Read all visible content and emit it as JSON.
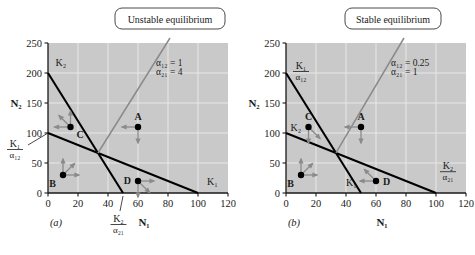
{
  "figure": {
    "background": "#ffffff",
    "plot_bg": "#c9c9c9",
    "grid_color": "#e8e8e8",
    "line_color": "#000000",
    "arrow_color": "#8a8a8a",
    "leader_color": "#8a8a8a"
  },
  "panels": [
    {
      "id": "a",
      "caption": "(a)",
      "callout": "Unstable equilibrium",
      "params": {
        "alpha12": "α₁₂ = 1",
        "alpha21": "α₂₁ = 4"
      },
      "axes": {
        "xlabel": "N₁",
        "ylabel": "N₂",
        "xticks": [
          "0",
          "20",
          "40",
          "60",
          "80",
          "100",
          "120"
        ],
        "yticks": [
          "0",
          "50",
          "100",
          "150",
          "200",
          "250"
        ],
        "xlim": [
          0,
          120
        ],
        "ylim": [
          0,
          250
        ]
      },
      "axis_annotations": [
        {
          "name": "k1-over-a12",
          "num": "K₁",
          "den": "α₁₂",
          "value": 100,
          "axis": "y"
        },
        {
          "name": "k2-over-a21",
          "num": "K₂",
          "den": "α₂₁",
          "value": 50,
          "axis": "x"
        }
      ],
      "curve_labels": [
        {
          "name": "k2-label",
          "text": "K₂",
          "x": 5,
          "y": 212
        },
        {
          "name": "k1-label",
          "text": "K₁",
          "x": 106,
          "y": 14
        }
      ],
      "isoclines": [
        {
          "name": "species1-isocline",
          "label": "K₁",
          "from": [
            0,
            100
          ],
          "to": [
            100,
            0
          ]
        },
        {
          "name": "species2-isocline",
          "label": "K₂",
          "from": [
            0,
            200
          ],
          "to": [
            50,
            0
          ]
        }
      ],
      "equilibrium": {
        "x": 33.3,
        "y": 66.7,
        "type": "unstable"
      },
      "points": [
        {
          "label": "A",
          "x": 60,
          "y": 110,
          "label_pos": "above"
        },
        {
          "label": "B",
          "x": 10,
          "y": 30,
          "label_pos": "below-left"
        },
        {
          "label": "C",
          "x": 15,
          "y": 110,
          "label_pos": "below-right"
        },
        {
          "label": "D",
          "x": 60,
          "y": 20,
          "label_pos": "left"
        }
      ],
      "vectors": [
        {
          "point": "A",
          "dirs": [
            "left",
            "down"
          ]
        },
        {
          "point": "B",
          "dirs": [
            "up",
            "up-right",
            "right"
          ]
        },
        {
          "point": "C",
          "dirs": [
            "left",
            "up-left",
            "up"
          ]
        },
        {
          "point": "D",
          "dirs": [
            "down",
            "right",
            "down-right"
          ]
        }
      ]
    },
    {
      "id": "b",
      "caption": "(b)",
      "callout": "Stable equilibrium",
      "params": {
        "alpha12": "α₁₂ = 0.25",
        "alpha21": "α₂₁ = 1"
      },
      "axes": {
        "xlabel": "N₁",
        "ylabel": "N₂",
        "xticks": [
          "0",
          "20",
          "40",
          "60",
          "80",
          "100",
          "120"
        ],
        "yticks": [
          "0",
          "50",
          "100",
          "150",
          "200",
          "250"
        ],
        "xlim": [
          0,
          120
        ],
        "ylim": [
          0,
          250
        ]
      },
      "axis_annotations": [
        {
          "name": "k1-over-a12",
          "num": "K₁",
          "den": "α₁₂",
          "value": 200,
          "axis": "y"
        },
        {
          "name": "k2-over-a21",
          "num": "K₂",
          "den": "α₂₁",
          "value": 100,
          "axis": "x"
        }
      ],
      "curve_labels": [
        {
          "name": "k2-label",
          "text": "K₂",
          "x": 3,
          "y": 103
        },
        {
          "name": "k1-label",
          "text": "K₁",
          "x": 40,
          "y": 12
        }
      ],
      "isoclines": [
        {
          "name": "species1-isocline",
          "label": "K₁",
          "from": [
            0,
            200
          ],
          "to": [
            50,
            0
          ]
        },
        {
          "name": "species2-isocline",
          "label": "K₂",
          "from": [
            0,
            100
          ],
          "to": [
            100,
            0
          ]
        }
      ],
      "equilibrium": {
        "x": 33.3,
        "y": 66.7,
        "type": "stable"
      },
      "points": [
        {
          "label": "A",
          "x": 50,
          "y": 110,
          "label_pos": "above"
        },
        {
          "label": "B",
          "x": 10,
          "y": 30,
          "label_pos": "below-left"
        },
        {
          "label": "C",
          "x": 15,
          "y": 110,
          "label_pos": "above"
        },
        {
          "label": "D",
          "x": 60,
          "y": 20,
          "label_pos": "right"
        }
      ],
      "vectors": [
        {
          "point": "A",
          "dirs": [
            "left",
            "down"
          ]
        },
        {
          "point": "B",
          "dirs": [
            "up",
            "up-right",
            "right"
          ]
        },
        {
          "point": "C",
          "dirs": [
            "down",
            "down-right"
          ]
        },
        {
          "point": "D",
          "dirs": [
            "up-left",
            "left"
          ]
        }
      ]
    }
  ],
  "chart_data": {
    "type": "line",
    "xlabel": "N1",
    "ylabel": "N2",
    "xlim": [
      0,
      120
    ],
    "ylim": [
      0,
      250
    ],
    "xticks": [
      0,
      20,
      40,
      60,
      80,
      100,
      120
    ],
    "yticks": [
      0,
      50,
      100,
      150,
      200,
      250
    ],
    "grid": true,
    "legend": "none",
    "panels": [
      {
        "panel": "a",
        "annotation": "Unstable equilibrium",
        "alpha12": 1,
        "alpha21": 4,
        "series": [
          {
            "name": "K1 isocline (species 1)",
            "x": [
              0,
              100
            ],
            "values": [
              100,
              0
            ]
          },
          {
            "name": "K2 isocline (species 2)",
            "x": [
              0,
              50
            ],
            "values": [
              200,
              0
            ]
          }
        ],
        "equilibrium_point": {
          "x": 33.3,
          "y": 66.7
        },
        "points": [
          {
            "name": "A",
            "x": 60,
            "y": 110
          },
          {
            "name": "B",
            "x": 10,
            "y": 30
          },
          {
            "name": "C",
            "x": 15,
            "y": 110
          },
          {
            "name": "D",
            "x": 60,
            "y": 20
          }
        ]
      },
      {
        "panel": "b",
        "annotation": "Stable equilibrium",
        "alpha12": 0.25,
        "alpha21": 1,
        "series": [
          {
            "name": "K1/a12 isocline (species 1)",
            "x": [
              0,
              50
            ],
            "values": [
              200,
              0
            ]
          },
          {
            "name": "K2 isocline (species 2)",
            "x": [
              0,
              100
            ],
            "values": [
              100,
              0
            ]
          }
        ],
        "equilibrium_point": {
          "x": 33.3,
          "y": 66.7
        },
        "points": [
          {
            "name": "A",
            "x": 50,
            "y": 110
          },
          {
            "name": "B",
            "x": 10,
            "y": 30
          },
          {
            "name": "C",
            "x": 15,
            "y": 110
          },
          {
            "name": "D",
            "x": 60,
            "y": 20
          }
        ]
      }
    ]
  }
}
